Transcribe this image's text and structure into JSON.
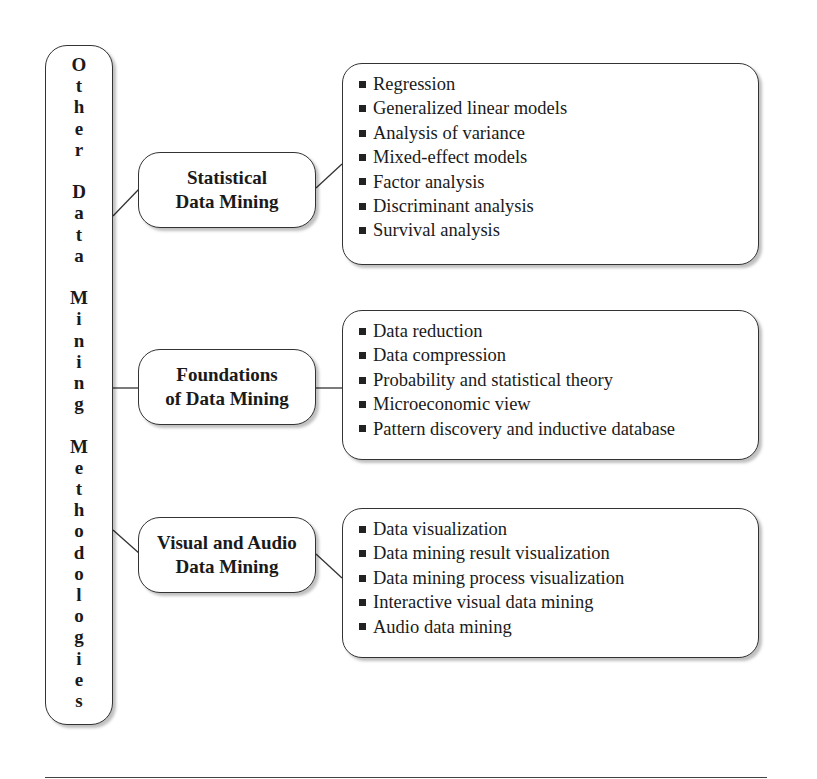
{
  "root": {
    "title": "Other Data Mining Methodologies",
    "letters": [
      "O",
      "t",
      "h",
      "e",
      "r",
      " ",
      "D",
      "a",
      "t",
      "a",
      " ",
      "M",
      "i",
      "n",
      "i",
      "n",
      "g",
      " ",
      "M",
      "e",
      "t",
      "h",
      "o",
      "d",
      "o",
      "l",
      "o",
      "g",
      "i",
      "e",
      "s"
    ]
  },
  "categories": [
    {
      "title_lines": [
        "Statistical",
        "Data Mining"
      ],
      "items": [
        "Regression",
        "Generalized linear models",
        "Analysis of variance",
        "Mixed-effect models",
        "Factor analysis",
        "Discriminant analysis",
        "Survival analysis"
      ]
    },
    {
      "title_lines": [
        "Foundations",
        "of Data Mining"
      ],
      "items": [
        "Data reduction",
        "Data compression",
        "Probability and statistical theory",
        "Microeconomic view",
        "Pattern discovery and inductive database"
      ]
    },
    {
      "title_lines": [
        "Visual and Audio",
        "Data Mining"
      ],
      "items": [
        "Data visualization",
        "Data mining result visualization",
        "Data mining process visualization",
        "Interactive visual data mining",
        "Audio data mining"
      ]
    }
  ]
}
